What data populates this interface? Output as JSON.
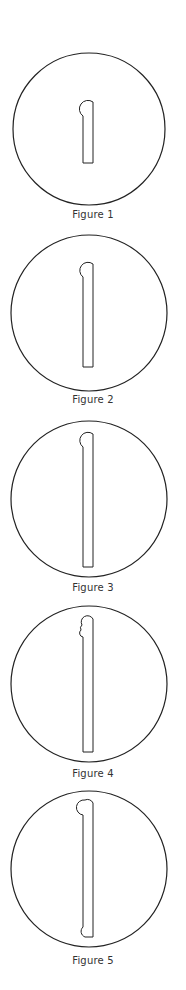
{
  "figures": [
    {
      "label": "Figure 1",
      "variant": "short-stem-round-head"
    },
    {
      "label": "Figure 2",
      "variant": "medium-stem-round-head"
    },
    {
      "label": "Figure 3",
      "variant": "long-stem-round-head"
    },
    {
      "label": "Figure 4",
      "variant": "long-stem-double-bump-head"
    },
    {
      "label": "Figure 5",
      "variant": "long-stem-round-head-and-foot"
    }
  ],
  "colors": {
    "stroke": "#222222",
    "caption": "#333333",
    "background": "#ffffff"
  }
}
